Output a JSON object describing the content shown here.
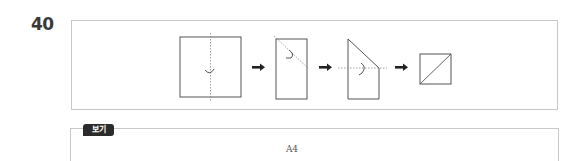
{
  "question": {
    "number": "40"
  },
  "figure": {
    "steps": [
      {
        "shape": "square",
        "fold": "vertical-center dotted line with fold arrow"
      },
      {
        "shape": "tall-rectangle",
        "fold": "diagonal dotted line with fold arrow"
      },
      {
        "shape": "triangle-over-rectangle",
        "fold": "horizontal dotted line with fold arrow"
      },
      {
        "shape": "square-with-diagonal",
        "fold": "none"
      }
    ],
    "arrow_icon": "right-arrow"
  },
  "bogi": {
    "label": "보기",
    "content": "A4"
  }
}
